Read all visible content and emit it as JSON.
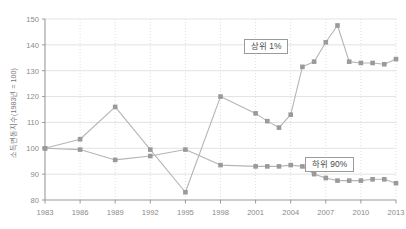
{
  "chart_data": {
    "type": "line",
    "title": "",
    "subtitle": "",
    "xlabel": "",
    "ylabel": "소득변동지수(1983년 = 100)",
    "xlim": [
      1983,
      2013
    ],
    "ylim": [
      80,
      150
    ],
    "grid": true,
    "legend_position": "inline-annotation",
    "x_tick_labels": [
      "1983",
      "1986",
      "1989",
      "1992",
      "1995",
      "1998",
      "2001",
      "2004",
      "2007",
      "2010",
      "2013"
    ],
    "x_ticks": [
      1983,
      1986,
      1989,
      1992,
      1995,
      1998,
      2001,
      2004,
      2007,
      2010,
      2013
    ],
    "y_tick_labels": [
      "80",
      "90",
      "100",
      "110",
      "120",
      "130",
      "140",
      "150"
    ],
    "y_ticks": [
      80,
      90,
      100,
      110,
      120,
      130,
      140,
      150
    ],
    "marker": "square",
    "marker_color": "#9a9a9a",
    "line_color": "#b5b5b5",
    "x": [
      1983,
      1986,
      1989,
      1992,
      1995,
      1998,
      2001,
      2002,
      2003,
      2004,
      2005,
      2006,
      2007,
      2008,
      2009,
      2010,
      2011,
      2012,
      2013
    ],
    "series": [
      {
        "name": "상위 1%",
        "label": "상위 1%",
        "values": [
          100,
          103.5,
          116,
          99.5,
          83,
          120,
          113.5,
          110.5,
          108,
          113,
          131.5,
          133.5,
          141,
          147.5,
          133.5,
          133,
          133,
          132.5,
          134.5
        ]
      },
      {
        "name": "하위 90%",
        "label": "하위 90%",
        "values": [
          100,
          99.5,
          95.5,
          97,
          99.5,
          93.5,
          93,
          93,
          93,
          93.5,
          93,
          90,
          88.5,
          87.5,
          87.5,
          87.5,
          88,
          88,
          86.5
        ]
      }
    ],
    "annotations": [
      {
        "text": "상위 1%",
        "series": "상위 1%"
      },
      {
        "text": "하위 90%",
        "series": "하위 90%"
      }
    ]
  }
}
